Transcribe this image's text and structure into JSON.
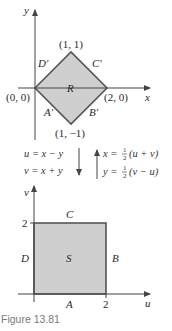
{
  "colors": {
    "region_fill": "#cfcfcf",
    "region_stroke": "#555555",
    "axis": "#444444",
    "caption": "#7a7a7a"
  },
  "top_plot": {
    "x_axis_label": "x",
    "y_axis_label": "y",
    "region_label": "R",
    "vertices": [
      {
        "label": "(0, 0)",
        "x": 0,
        "y": 0
      },
      {
        "label": "(1, 1)",
        "x": 1,
        "y": 1
      },
      {
        "label": "(2, 0)",
        "x": 2,
        "y": 0
      },
      {
        "label": "(1, −1)",
        "x": 1,
        "y": -1
      }
    ],
    "edge_labels": {
      "A": "A′",
      "B": "B′",
      "C": "C′",
      "D": "D′"
    }
  },
  "transform": {
    "forward": [
      "u = x − y",
      "v = x + y"
    ],
    "inverse_x": {
      "lhs": "x = ",
      "num": "1",
      "den": "2",
      "rhs": "(u + v)"
    },
    "inverse_y": {
      "lhs": "y = ",
      "num": "1",
      "den": "2",
      "rhs": "(v − u)"
    }
  },
  "bottom_plot": {
    "x_axis_label": "u",
    "y_axis_label": "v",
    "region_label": "S",
    "u_tick": "2",
    "v_tick": "2",
    "edge_labels": {
      "A": "A",
      "B": "B",
      "C": "C",
      "D": "D"
    }
  },
  "caption": "Figure 13.81"
}
